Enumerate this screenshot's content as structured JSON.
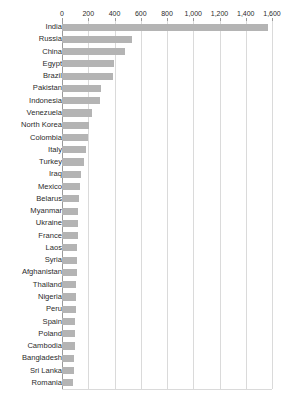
{
  "header": {
    "ghost_text": ""
  },
  "chart_data": {
    "type": "bar",
    "orientation": "horizontal",
    "title": "",
    "subtitle": "",
    "xlabel": "",
    "ylabel": "",
    "xlim": [
      0,
      1600
    ],
    "grid": true,
    "legend": false,
    "bar_color": "#b4b4b4",
    "gridline_color": "#dadada",
    "axis_color": "#9a9a9a",
    "text_color": "#2b2b2b",
    "xticks": [
      0,
      200,
      400,
      600,
      800,
      1000,
      1200,
      1400,
      1600
    ],
    "xtick_labels": [
      "0",
      "200",
      "400",
      "600",
      "800",
      "1,000",
      "1,200",
      "1,400",
      "1,600"
    ],
    "categories": [
      "India",
      "Russia",
      "China",
      "Egypt",
      "Brazil",
      "Pakistan",
      "Indonesia",
      "Venezuela",
      "North Korea",
      "Colombia",
      "Italy",
      "Turkey",
      "Iraq",
      "Mexico",
      "Belarus",
      "Myanmar",
      "Ukraine",
      "France",
      "Laos",
      "Syria",
      "Afghanistan",
      "Thailand",
      "Nigeria",
      "Peru",
      "Spain",
      "Poland",
      "Cambodia",
      "Bangladesh",
      "Sri Lanka",
      "Romania"
    ],
    "values": [
      1570,
      530,
      480,
      395,
      390,
      295,
      290,
      230,
      205,
      200,
      185,
      170,
      145,
      140,
      130,
      125,
      122,
      120,
      118,
      115,
      112,
      110,
      108,
      105,
      102,
      100,
      96,
      92,
      88,
      82
    ]
  }
}
